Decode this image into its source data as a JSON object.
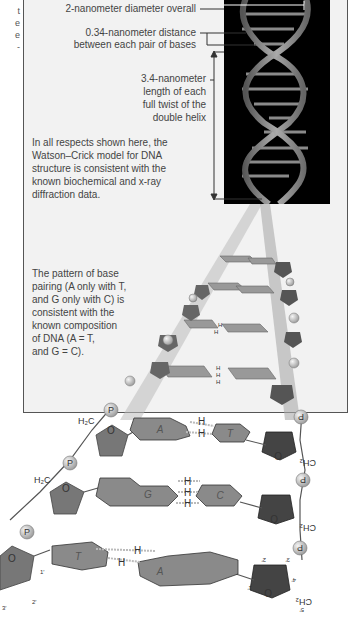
{
  "left_edge_text": [
    "t",
    "e",
    "e",
    "-"
  ],
  "labels": {
    "diameter": "2-nanometer diameter overall",
    "distance_l1": "0.34-nanometer distance",
    "distance_l2": "between each pair of bases",
    "twist_l1": "3.4-nanometer",
    "twist_l2": "length of each",
    "twist_l3": "full twist of the",
    "twist_l4": "double helix"
  },
  "model_text": [
    "In all respects shown here, the",
    "Watson–Crick model for DNA",
    "structure is consistent with the",
    "known biochemical and x-ray",
    "diffraction data."
  ],
  "pairing_text": [
    "The pattern of base",
    "pairing (A only with T,",
    "and G only with C) is",
    "consistent with the",
    "known composition",
    "of DNA (A = T,",
    "and G = C)."
  ],
  "base_pairs": [
    {
      "left": "A",
      "right": "T",
      "h_bonds": 2
    },
    {
      "left": "G",
      "right": "C",
      "h_bonds": 3
    },
    {
      "left": "T",
      "right": "A",
      "h_bonds": 2
    }
  ],
  "chem": {
    "phosphate": "P",
    "oxygen": "O",
    "hydrogen": "H",
    "h2c": "H₂C",
    "ch2": "CH₂",
    "carbons_left": [
      "1′",
      "2′",
      "3′"
    ],
    "carbons_right": [
      "1′",
      "2′",
      "3′",
      "4′",
      "5′"
    ]
  }
}
